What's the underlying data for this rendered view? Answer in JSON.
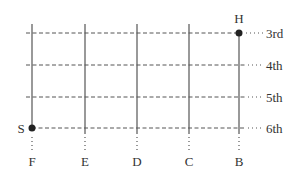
{
  "diagram": {
    "type": "grid",
    "columns": [
      {
        "label": "F",
        "x": 32
      },
      {
        "label": "E",
        "x": 85
      },
      {
        "label": "D",
        "x": 137
      },
      {
        "label": "C",
        "x": 189
      },
      {
        "label": "B",
        "x": 239
      }
    ],
    "rows": [
      {
        "label": "3rd",
        "y": 33
      },
      {
        "label": "4th",
        "y": 65
      },
      {
        "label": "5th",
        "y": 97
      },
      {
        "label": "6th",
        "y": 128
      }
    ],
    "points": [
      {
        "label": "H",
        "column": "B",
        "row": "3rd"
      },
      {
        "label": "S",
        "column": "F",
        "row": "6th"
      }
    ]
  }
}
